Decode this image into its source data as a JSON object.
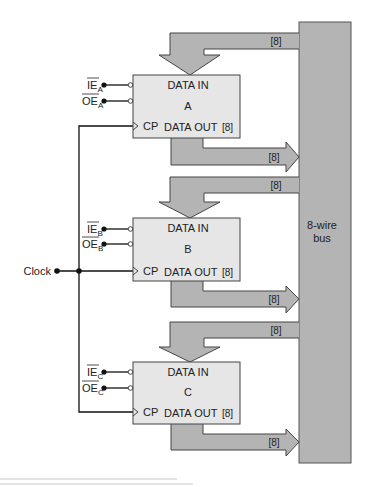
{
  "colors": {
    "bus_fill": "#b4b4b4",
    "arrow_fill": "#b4b4b4",
    "register_fill": "#e6e6e6",
    "stroke": "#333333",
    "wire": "#111111",
    "rule": "#c8c8c8"
  },
  "bus": {
    "label_line1": "8-wire",
    "label_line2": "bus"
  },
  "clock": {
    "label": "Clock"
  },
  "registers": [
    {
      "name": "A",
      "data_in": "DATA IN",
      "data_out": "DATA OUT",
      "width_label": "[8]",
      "cp_label": "CP",
      "ie_label": "IE",
      "oe_label": "OE",
      "subscript": "A",
      "in_bus_label": "[8]",
      "out_bus_label": "[8]"
    },
    {
      "name": "B",
      "data_in": "DATA IN",
      "data_out": "DATA OUT",
      "width_label": "[8]",
      "cp_label": "CP",
      "ie_label": "IE",
      "oe_label": "OE",
      "subscript": "B",
      "in_bus_label": "[8]",
      "out_bus_label": "[8]"
    },
    {
      "name": "C",
      "data_in": "DATA IN",
      "data_out": "DATA OUT",
      "width_label": "[8]",
      "cp_label": "CP",
      "ie_label": "IE",
      "oe_label": "OE",
      "subscript": "C",
      "in_bus_label": "[8]",
      "out_bus_label": "[8]"
    }
  ]
}
